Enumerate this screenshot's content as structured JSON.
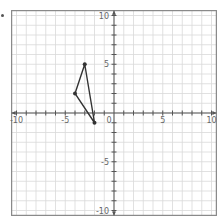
{
  "chart_data": {
    "type": "scatter",
    "title": "",
    "xlabel": "",
    "ylabel": "",
    "xlim": [
      -10.5,
      10.5
    ],
    "ylim": [
      -10.5,
      10.5
    ],
    "grid": true,
    "x_ticks": [
      -10,
      -5,
      0,
      5,
      10
    ],
    "y_ticks": [
      -10,
      -5,
      5,
      10
    ],
    "x_tick_labels": [
      "-10",
      "-5",
      "0",
      "5",
      "10"
    ],
    "y_tick_labels": [
      "-10",
      "-5",
      "5",
      "10"
    ],
    "series": [
      {
        "name": "triangle",
        "shape": "polygon",
        "points": [
          [
            -4,
            2
          ],
          [
            -3,
            5
          ],
          [
            -2,
            -1
          ]
        ]
      }
    ]
  },
  "colors": {
    "grid": "#d9d9d9",
    "axis": "#555555",
    "border": "#888888",
    "shape": "#333333"
  }
}
